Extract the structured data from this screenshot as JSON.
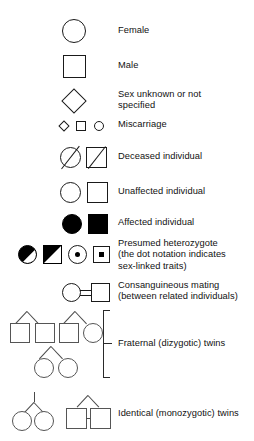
{
  "figure": {
    "kind": "pedigree-symbol-legend",
    "line_color": "#1a1a1a",
    "fill_color": "#000000",
    "background": "#ffffff"
  },
  "rows": [
    {
      "id": "female",
      "symbols": [
        "circle"
      ],
      "label": "Female",
      "label_line2": ""
    },
    {
      "id": "male",
      "symbols": [
        "square"
      ],
      "label": "Male",
      "label_line2": ""
    },
    {
      "id": "sex-unknown",
      "symbols": [
        "diamond"
      ],
      "label": "Sex unknown or not",
      "label_line2": "specified"
    },
    {
      "id": "miscarriage",
      "symbols": [
        "small-diamond",
        "small-square",
        "small-circle"
      ],
      "label": "Miscarriage",
      "label_line2": ""
    },
    {
      "id": "deceased",
      "symbols": [
        "circle-slashed",
        "square-slashed"
      ],
      "label": "Deceased individual",
      "label_line2": ""
    },
    {
      "id": "unaffected",
      "symbols": [
        "circle",
        "square"
      ],
      "label": "Unaffected individual",
      "label_line2": ""
    },
    {
      "id": "affected",
      "symbols": [
        "circle-filled",
        "square-filled"
      ],
      "label": "Affected individual",
      "label_line2": ""
    },
    {
      "id": "presumed-heterozygote",
      "symbols": [
        "circle-half-filled",
        "square-half-filled",
        "circle-dot",
        "square-dot"
      ],
      "label": "Presumed heterozygote",
      "label_line2": "(the dot notation indicates",
      "label_line3": "sex-linked traits)"
    },
    {
      "id": "consanguineous-mating",
      "symbols": [
        "circle",
        "double-line",
        "square"
      ],
      "label": "Consanguineous mating",
      "label_line2": "(between related individuals)"
    },
    {
      "id": "fraternal-twins",
      "symbols": [
        "twin-fork-square-square",
        "twin-fork-square-circle",
        "twin-fork-circle-circle"
      ],
      "label": "Fraternal (dizygotic) twins",
      "label_line2": ""
    },
    {
      "id": "identical-twins",
      "symbols": [
        "mz-twin-circles",
        "mz-twin-squares"
      ],
      "label": "Identical (monozygotic) twins",
      "label_line2": ""
    }
  ]
}
